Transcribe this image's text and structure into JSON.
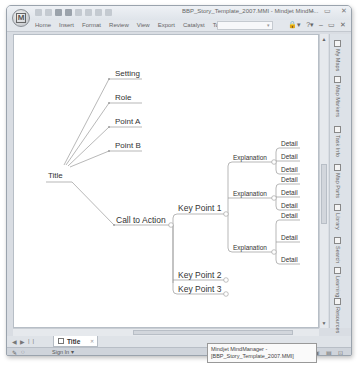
{
  "window": {
    "title": "BBP_Story_Template_2007.MMI - Mindjet MindM...",
    "app_button_label": "M",
    "controls": [
      "–",
      "▭",
      "✕"
    ]
  },
  "ribbon": {
    "tabs": [
      "Home",
      "Insert",
      "Format",
      "Review",
      "View",
      "Export",
      "Catalyst",
      "Tools"
    ],
    "search_placeholder": "▾",
    "right_icons": [
      "🔒▾",
      "?▾",
      "–",
      "▭",
      "✕"
    ]
  },
  "map": {
    "central": "Title",
    "upper_topics": [
      "Setting",
      "Role",
      "Point A",
      "Point B"
    ],
    "call_to_action": "Call to Action",
    "key_points": [
      "Key Point 1",
      "Key Point 2",
      "Key Point 3"
    ],
    "explanations": [
      "Explanation",
      "Explanation",
      "Explanation"
    ],
    "detail": "Detail"
  },
  "side_panel": {
    "items": [
      "My Maps",
      "Map Markers",
      "Task Info",
      "Map Parts",
      "Library",
      "Search",
      "Learning",
      "Resources"
    ]
  },
  "doc_tabs": {
    "nav": [
      "◀",
      "▶",
      "|",
      "|"
    ],
    "active_tab": "Title",
    "close": "✕"
  },
  "statusbar": {
    "left_icons": [
      "✎",
      "◌"
    ],
    "sign_in": "Sign In ▾",
    "right_icons": [
      "⇔",
      "▣",
      "▤",
      "⊡"
    ]
  },
  "tooltip": {
    "line1": "Mindjet MindManager -",
    "line2": "[BBP_Story_Template_2007.MMI]"
  }
}
